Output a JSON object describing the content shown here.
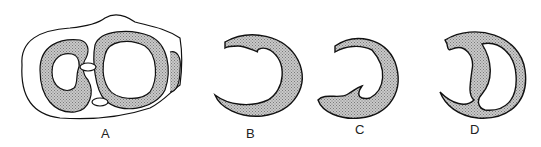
{
  "figure": {
    "panels": [
      {
        "id": "A",
        "label": "A",
        "description": "Cross-section with two chambers"
      },
      {
        "id": "B",
        "label": "B",
        "description": "Crescent wall with fold at top"
      },
      {
        "id": "C",
        "label": "C",
        "description": "Crescent wall with fold at bottom"
      },
      {
        "id": "D",
        "label": "D",
        "description": "Ring with S-shaped septum"
      }
    ],
    "colors": {
      "stroke": "#111111",
      "fill": "#b8b8b8",
      "background": "#ffffff"
    }
  }
}
